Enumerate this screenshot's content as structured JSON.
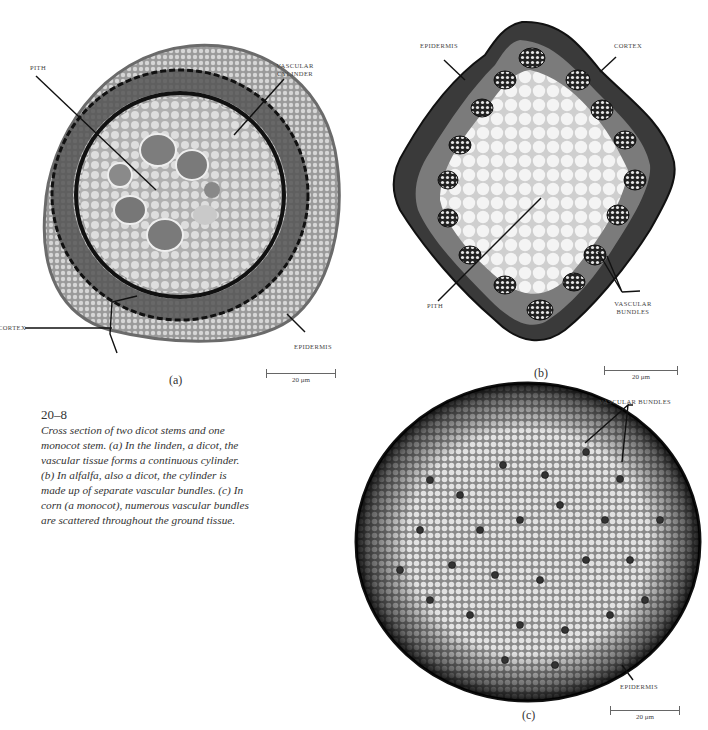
{
  "figure": {
    "number": "20–8",
    "caption_lines": [
      "Cross section of two dicot stems and one",
      "monocot stem. (a) In the linden, a dicot, the",
      "vascular tissue forms a continuous cylinder.",
      "(b) In alfalfa, also a dicot, the cylinder is",
      "made up of separate vascular bundles. (c) In",
      "corn (a monocot), numerous vascular bundles",
      "are scattered throughout the ground tissue."
    ]
  },
  "panels": {
    "a": {
      "letter": "(a)",
      "subject": "linden stem cross section",
      "labels": {
        "pith": "PITH",
        "vascular_cylinder_1": "VASCULAR",
        "vascular_cylinder_2": "CYLINDER",
        "cortex": "CORTEX",
        "epidermis": "EPIDERMIS"
      },
      "scale": "20 μm"
    },
    "b": {
      "letter": "(b)",
      "subject": "alfalfa stem cross section",
      "labels": {
        "epidermis": "EPIDERMIS",
        "cortex": "CORTEX",
        "pith": "PITH",
        "vascular_bundles_1": "VASCULAR",
        "vascular_bundles_2": "BUNDLES"
      },
      "scale": "20 μm"
    },
    "c": {
      "letter": "(c)",
      "subject": "corn stem cross section",
      "labels": {
        "vascular_bundles": "VASCULAR BUNDLES",
        "epidermis": "EPIDERMIS"
      },
      "scale": "20 μm"
    }
  }
}
